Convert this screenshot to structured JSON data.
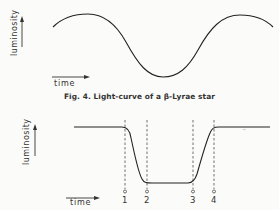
{
  "figures": [
    {
      "id": "fig4",
      "type": "sinusoidal light-curve",
      "ylabel": "luminosity",
      "xlabel": "time",
      "caption": "Fig. 4. Light-curve of a β-Lyrae star"
    },
    {
      "id": "fig5",
      "type": "eclipse light-curve",
      "ylabel": "luminosity",
      "xlabel": "time",
      "contact_markers": [
        "1",
        "2",
        "3",
        "4"
      ]
    }
  ]
}
